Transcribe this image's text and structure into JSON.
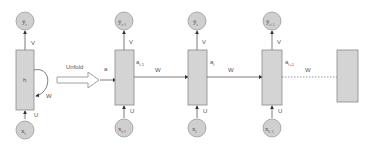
{
  "diagram": {
    "colors": {
      "block_fill": "#d4d4d4",
      "block_stroke": "#8a8a8a",
      "circle_fill": "#cfcfcf",
      "circle_stroke": "#9a9a9a",
      "line": "#5a5a5a",
      "text": "#555555"
    },
    "folded": {
      "output_label": "ŷ",
      "output_sub": "t",
      "hidden_label": "h",
      "input_label": "x",
      "input_sub": "t",
      "weight_v": "V",
      "weight_u": "U",
      "weight_w": "W"
    },
    "unfold_label": "Unfold",
    "initial_state_label": "a",
    "initial_state_sub": "t",
    "steps": [
      {
        "output": "ŷ",
        "output_sub": "t-1",
        "input": "x",
        "input_sub": "t-1",
        "state": "a",
        "state_sub": "t-1",
        "v": "V",
        "u": "U",
        "w": "W"
      },
      {
        "output": "ŷ",
        "output_sub": "t",
        "input": "x",
        "input_sub": "t",
        "state": "a",
        "state_sub": "t",
        "v": "V",
        "u": "U",
        "w": "W"
      },
      {
        "output": "ŷ",
        "output_sub": "t+1",
        "input": "x",
        "input_sub": "t+1",
        "state": "a",
        "state_sub": "t+1",
        "v": "V",
        "u": "U",
        "w": "W"
      }
    ]
  }
}
